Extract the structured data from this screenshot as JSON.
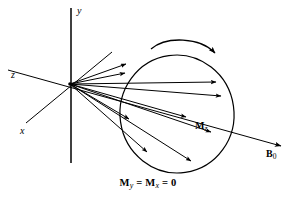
{
  "figure": {
    "type": "nmr-magnetization-vector-diagram",
    "background_color": "#ffffff",
    "stroke_color": "#000000"
  },
  "axes": {
    "y": {
      "label": "y",
      "x": 77,
      "y": 7
    },
    "z": {
      "label": "z",
      "x": 11,
      "y": 70
    },
    "x": {
      "label": "x",
      "x": 20,
      "y": 127
    }
  },
  "labels": {
    "mz": {
      "base": "M",
      "sub": "z",
      "x": 195,
      "y": 121
    },
    "b0": {
      "base": "B",
      "sub": "0",
      "x": 266,
      "y": 150
    }
  },
  "caption": {
    "m_symbol": "M",
    "sub_y": "y",
    "sub_x": "x",
    "equals": "=",
    "zero": "0",
    "full_text": "My = Mx = 0"
  },
  "geometry": {
    "origin": {
      "x": 70,
      "y": 84
    },
    "ellipse": {
      "cx": 177,
      "cy": 114,
      "rx": 57,
      "ry": 59,
      "rotation": -8
    },
    "y_axis_line": {
      "x1": 71,
      "y1": 8,
      "x2": 71,
      "y2": 163
    },
    "z_axis_line": {
      "x1": 8,
      "y1": 70,
      "x2": 283,
      "y2": 147
    },
    "x_axis_line": {
      "x1": 26,
      "y1": 123,
      "x2": 112,
      "y2": 52
    },
    "precession_arc": {
      "start_x": 151,
      "start_y": 49,
      "end_x": 217,
      "end_y": 57
    }
  },
  "vectors": [
    {
      "name": "magnetization-vector-1",
      "x2": 131,
      "y2": 64
    },
    {
      "name": "magnetization-vector-2",
      "x2": 130,
      "y2": 73
    },
    {
      "name": "magnetization-vector-3",
      "x2": 221,
      "y2": 82
    },
    {
      "name": "magnetization-vector-4",
      "x2": 226,
      "y2": 96
    },
    {
      "name": "magnetization-vector-5",
      "x2": 191,
      "y2": 118
    },
    {
      "name": "magnetization-vector-6",
      "x2": 216,
      "y2": 133
    },
    {
      "name": "magnetization-vector-7",
      "x2": 133,
      "y2": 121
    },
    {
      "name": "magnetization-vector-8",
      "x2": 151,
      "y2": 155
    },
    {
      "name": "magnetization-vector-9",
      "x2": 196,
      "y2": 164
    }
  ]
}
